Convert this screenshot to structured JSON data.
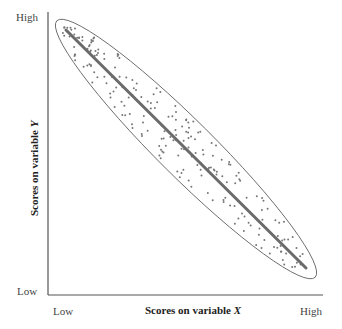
{
  "chart_data": {
    "type": "scatter",
    "title": "",
    "xlabel": "Scores on variable X",
    "ylabel": "Scores on variable Y",
    "x_ticks": [
      "Low",
      "High"
    ],
    "y_ticks": [
      "Low",
      "High"
    ],
    "grid": false,
    "legend": null,
    "relationship": "strong negative linear correlation",
    "regression_line": {
      "from": {
        "x": "Low",
        "y": "High"
      },
      "to": {
        "x": "High",
        "y": "Low"
      }
    },
    "envelope": "ellipse enclosing points along regression line",
    "points_note": "approx. 200 scattered points tightly clustered around a descending line"
  },
  "labels": {
    "y_high": "High",
    "y_low": "Low",
    "x_low": "Low",
    "x_high": "High",
    "x_title_prefix": "Scores on variable ",
    "x_title_var": "X",
    "y_title_prefix": "Scores on variable ",
    "y_title_var": "Y"
  },
  "colors": {
    "axis": "#555555",
    "line": "#6b6b6b",
    "points": "#777777",
    "ellipse": "#666666"
  }
}
